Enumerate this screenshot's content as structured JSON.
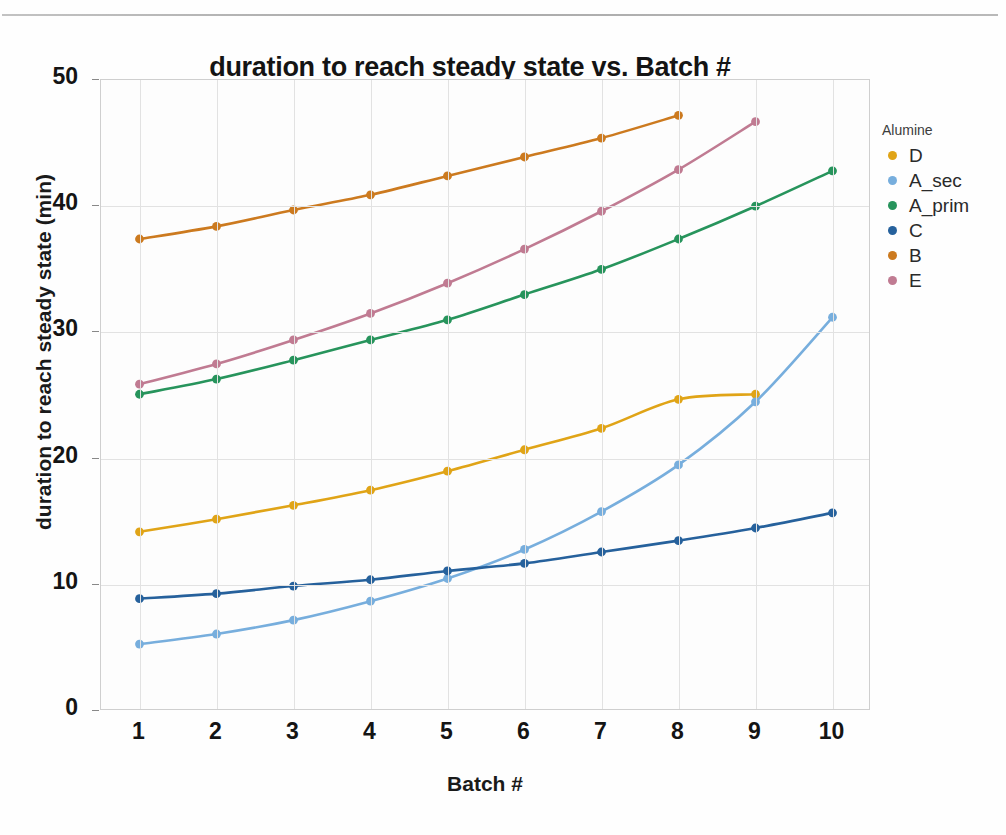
{
  "page": {
    "top_clipped_text": "",
    "page_number": ""
  },
  "chart_data": {
    "type": "line",
    "title": "duration to reach steady state vs. Batch #",
    "xlabel": "Batch #",
    "ylabel": "duration to reach steady state (min)",
    "xlim": [
      0.5,
      10.5
    ],
    "ylim": [
      0,
      50
    ],
    "xticks": [
      1,
      2,
      3,
      4,
      5,
      6,
      7,
      8,
      9,
      10
    ],
    "yticks": [
      0,
      10,
      20,
      30,
      40,
      50
    ],
    "grid": true,
    "markers": true,
    "legend_position": "right",
    "legend_title": "Alumine",
    "series": [
      {
        "name": "D",
        "color": "#E0A417",
        "x": [
          1,
          2,
          3,
          4,
          5,
          6,
          7,
          8,
          9
        ],
        "values": [
          14.2,
          15.2,
          16.3,
          17.5,
          19.0,
          20.7,
          22.4,
          24.7,
          25.1
        ]
      },
      {
        "name": "A_sec",
        "color": "#77AEDD",
        "x": [
          1,
          2,
          3,
          4,
          5,
          6,
          7,
          8,
          9,
          10
        ],
        "values": [
          5.3,
          6.1,
          7.2,
          8.7,
          10.5,
          12.8,
          15.8,
          19.5,
          24.5,
          31.2
        ]
      },
      {
        "name": "A_prim",
        "color": "#27945C",
        "x": [
          1,
          2,
          3,
          4,
          5,
          6,
          7,
          8,
          9,
          10
        ],
        "values": [
          25.1,
          26.3,
          27.8,
          29.4,
          31.0,
          33.0,
          35.0,
          37.4,
          40.0,
          42.8
        ]
      },
      {
        "name": "C",
        "color": "#26619C",
        "x": [
          1,
          2,
          3,
          4,
          5,
          6,
          7,
          8,
          9,
          10
        ],
        "values": [
          8.9,
          9.3,
          9.9,
          10.4,
          11.1,
          11.7,
          12.6,
          13.5,
          14.5,
          15.7
        ]
      },
      {
        "name": "B",
        "color": "#CC7A1F",
        "x": [
          1,
          2,
          3,
          4,
          5,
          6,
          7,
          8
        ],
        "values": [
          37.4,
          38.4,
          39.7,
          40.9,
          42.4,
          43.9,
          45.4,
          47.2
        ]
      },
      {
        "name": "E",
        "color": "#C07B92",
        "x": [
          1,
          2,
          3,
          4,
          5,
          6,
          7,
          8,
          9
        ],
        "values": [
          25.9,
          27.5,
          29.4,
          31.5,
          33.9,
          36.6,
          39.6,
          42.9,
          46.7
        ]
      }
    ]
  }
}
